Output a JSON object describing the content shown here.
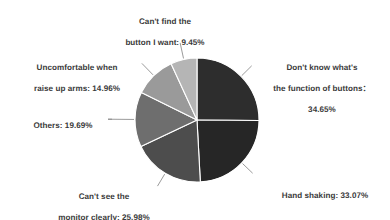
{
  "chart_data": {
    "type": "pie",
    "title": "",
    "subtitle": "",
    "xlabel": "",
    "ylabel": "",
    "legend_position": "none",
    "grid": false,
    "note": "Multi-select survey: percentages sum to more than 100%",
    "start_angle_deg": 0,
    "direction": "clockwise",
    "total_percent": 117.8,
    "categories": [
      "Don't know what's the function of buttons",
      "Hand shaking",
      "Can't see the monitor clearly",
      "Others",
      "Uncomfortable when raise up arms",
      "Can't find the button I want"
    ],
    "values": [
      34.65,
      33.07,
      25.98,
      19.69,
      14.96,
      9.45
    ],
    "slices": [
      {
        "name": "dont-know-function-of-buttons",
        "label_line1": "Don't know what's",
        "label_line2": "the function of buttons：",
        "label_line3": "34.65%",
        "value": 34.65,
        "value_text": "34.65%",
        "color": "#2d2d2d"
      },
      {
        "name": "hand-shaking",
        "label_line1": "Hand shaking: 33.07%",
        "label_line2": "",
        "label_line3": "",
        "value": 33.07,
        "value_text": "33.07%",
        "color": "#262626"
      },
      {
        "name": "cant-see-monitor-clearly",
        "label_line1": "Can't see the",
        "label_line2": "monitor clearly: 25.98%",
        "label_line3": "",
        "value": 25.98,
        "value_text": "25.98%",
        "color": "#4d4d4d"
      },
      {
        "name": "others",
        "label_line1": "Others: 19.69%",
        "label_line2": "",
        "label_line3": "",
        "value": 19.69,
        "value_text": "19.69%",
        "color": "#6e6e6e"
      },
      {
        "name": "uncomfortable-raise-up-arms",
        "label_line1": "Uncomfortable when",
        "label_line2": "raise up arms: 14.96%",
        "label_line3": "",
        "value": 14.96,
        "value_text": "14.96%",
        "color": "#9a9a9a"
      },
      {
        "name": "cant-find-button",
        "label_line1": "Can't find the",
        "label_line2": "button I want: 9.45%",
        "label_line3": "",
        "value": 9.45,
        "value_text": "9.45%",
        "color": "#b5b5b5"
      }
    ],
    "style": {
      "separator_color": "#ffffff",
      "leader_line_color": "#808080",
      "text_color": "#3a3a3a",
      "background": "#ffffff"
    },
    "geometry": {
      "center_x": 197,
      "center_y": 120,
      "radius": 62
    }
  },
  "labels": {
    "cant_find": {
      "line1": "Can't find the",
      "line2": "button I want: 9.45%"
    },
    "dont_know": {
      "line1": "Don't know what's",
      "line2": "the function of buttons：",
      "line3": "34.65%"
    },
    "hand_shaking": {
      "line1": "Hand shaking: 33.07%"
    },
    "cant_see": {
      "line1": "Can't see the",
      "line2": "monitor clearly: 25.98%"
    },
    "others": {
      "line1": "Others: 19.69%"
    },
    "uncomfortable": {
      "line1": "Uncomfortable when",
      "line2": "raise up arms: 14.96%"
    }
  }
}
